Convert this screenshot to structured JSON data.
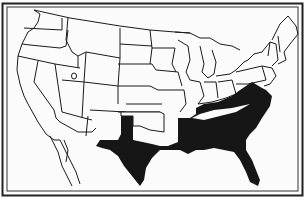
{
  "map": {
    "subject": "United States with Confederate states shaded",
    "colors": {
      "paper": "#fbfbfb",
      "ink": "#1a1a1a",
      "shaded": "#161616",
      "frame": "#2a2a2a"
    },
    "shaded_region": "Confederate States",
    "shaded_states": [
      "Texas",
      "Arkansas",
      "Louisiana",
      "Mississippi",
      "Alabama",
      "Georgia",
      "Florida",
      "South Carolina",
      "North Carolina",
      "Tennessee",
      "Virginia"
    ],
    "labels": []
  }
}
